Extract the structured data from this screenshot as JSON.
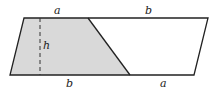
{
  "diagram": {
    "type": "geometry",
    "labels": {
      "top_left_segment": "a",
      "top_right_segment": "b",
      "bottom_left_segment": "b",
      "bottom_right_segment": "a",
      "height": "h"
    },
    "colors": {
      "shade": "#d9d9d9",
      "stroke": "#222222",
      "background": "#ffffff"
    }
  }
}
